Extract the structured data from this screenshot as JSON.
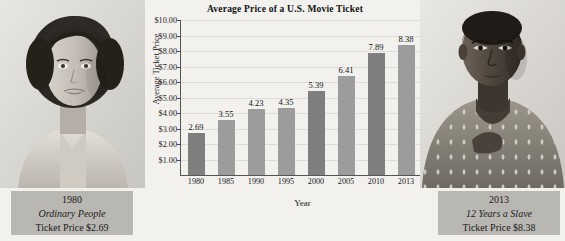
{
  "figure": {
    "background_color": "#f2f1ee"
  },
  "left_panel": {
    "photo_alt": "portrait-actress-1980",
    "caption": {
      "year": "1980",
      "film": "Ordinary People",
      "price_line": "Ticket Price $2.69"
    }
  },
  "right_panel": {
    "photo_alt": "portrait-actress-2013",
    "caption": {
      "year": "2013",
      "film": "12 Years a Slave",
      "price_line": "Ticket Price $8.38"
    }
  },
  "chart_data": {
    "type": "bar",
    "title": "Average Price of a U.S. Movie Ticket",
    "xlabel": "Year",
    "ylabel": "Average Ticket Price",
    "categories": [
      "1980",
      "1985",
      "1990",
      "1995",
      "2000",
      "2005",
      "2010",
      "2013"
    ],
    "values": [
      2.69,
      3.55,
      4.23,
      4.35,
      5.39,
      6.41,
      7.89,
      8.38
    ],
    "value_labels": [
      "2.69",
      "3.55",
      "4.23",
      "4.35",
      "5.39",
      "6.41",
      "7.89",
      "8.38"
    ],
    "bar_shades": [
      "dark",
      "light",
      "light",
      "light",
      "dark",
      "light",
      "dark",
      "light"
    ],
    "bar_colors": {
      "dark": "#7f7f7f",
      "light": "#9c9c9c"
    },
    "ylim": [
      0,
      10
    ],
    "ytick_labels": [
      "$1.00",
      "$2.00",
      "$3.00",
      "$4.00",
      "$5.00",
      "$6.00",
      "$7.00",
      "$8.00",
      "$9.00",
      "$10.00"
    ],
    "ytick_values": [
      1,
      2,
      3,
      4,
      5,
      6,
      7,
      8,
      9,
      10
    ],
    "grid": true,
    "legend": null
  }
}
